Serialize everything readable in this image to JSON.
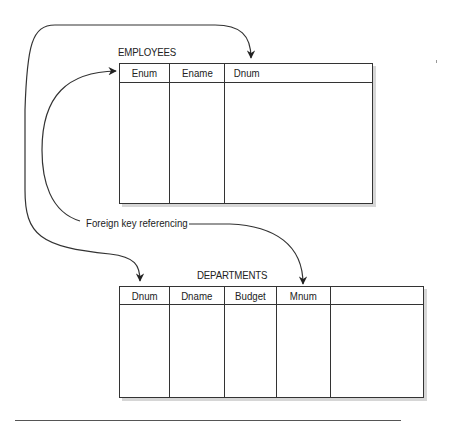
{
  "diagram": {
    "label": "Foreign key referencing",
    "tables": [
      {
        "name": "EMPLOYEES",
        "columns": [
          "Enum",
          "Ename",
          "Dnum"
        ]
      },
      {
        "name": "DEPARTMENTS",
        "columns": [
          "Dnum",
          "Dname",
          "Budget",
          "Mnum",
          ""
        ]
      }
    ],
    "relationships": [
      {
        "from": "EMPLOYEES.Dnum",
        "to": "DEPARTMENTS.Dnum"
      },
      {
        "from": "DEPARTMENTS.Mnum",
        "to": "EMPLOYEES.Enum"
      }
    ],
    "colors": {
      "line": "#333333",
      "shadow": "#d6d6d6",
      "background": "#ffffff"
    }
  }
}
